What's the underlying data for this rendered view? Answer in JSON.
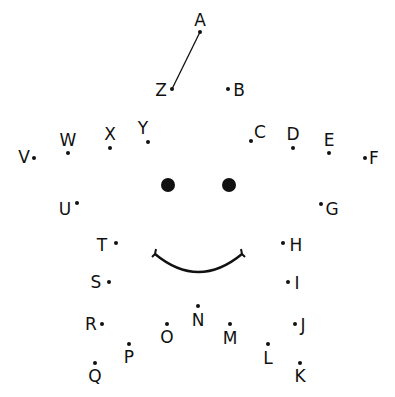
{
  "colors": {
    "ink": "#111111",
    "background": "#ffffff"
  },
  "points": [
    {
      "letter": "A",
      "x": 200,
      "y": 32,
      "lx": 200,
      "ly": 20
    },
    {
      "letter": "B",
      "x": 228,
      "y": 89,
      "lx": 239,
      "ly": 90
    },
    {
      "letter": "C",
      "x": 251,
      "y": 141,
      "lx": 260,
      "ly": 132
    },
    {
      "letter": "D",
      "x": 293,
      "y": 148,
      "lx": 293,
      "ly": 134
    },
    {
      "letter": "E",
      "x": 329,
      "y": 153,
      "lx": 329,
      "ly": 140
    },
    {
      "letter": "F",
      "x": 365,
      "y": 158,
      "lx": 374,
      "ly": 158
    },
    {
      "letter": "G",
      "x": 321,
      "y": 204,
      "lx": 332,
      "ly": 209
    },
    {
      "letter": "H",
      "x": 283,
      "y": 243,
      "lx": 296,
      "ly": 245
    },
    {
      "letter": "I",
      "x": 288,
      "y": 282,
      "lx": 297,
      "ly": 283
    },
    {
      "letter": "J",
      "x": 295,
      "y": 324,
      "lx": 303,
      "ly": 325
    },
    {
      "letter": "K",
      "x": 300,
      "y": 363,
      "lx": 300,
      "ly": 376
    },
    {
      "letter": "L",
      "x": 268,
      "y": 344,
      "lx": 268,
      "ly": 358
    },
    {
      "letter": "M",
      "x": 230,
      "y": 324,
      "lx": 230,
      "ly": 338
    },
    {
      "letter": "N",
      "x": 198,
      "y": 306,
      "lx": 198,
      "ly": 320
    },
    {
      "letter": "O",
      "x": 167,
      "y": 324,
      "lx": 167,
      "ly": 337
    },
    {
      "letter": "P",
      "x": 129,
      "y": 344,
      "lx": 129,
      "ly": 357
    },
    {
      "letter": "Q",
      "x": 95,
      "y": 363,
      "lx": 95,
      "ly": 376
    },
    {
      "letter": "R",
      "x": 102,
      "y": 324,
      "lx": 91,
      "ly": 324
    },
    {
      "letter": "S",
      "x": 109,
      "y": 282,
      "lx": 96,
      "ly": 282
    },
    {
      "letter": "T",
      "x": 116,
      "y": 243,
      "lx": 102,
      "ly": 245
    },
    {
      "letter": "U",
      "x": 77,
      "y": 203,
      "lx": 65,
      "ly": 209
    },
    {
      "letter": "V",
      "x": 34,
      "y": 158,
      "lx": 24,
      "ly": 157
    },
    {
      "letter": "W",
      "x": 68,
      "y": 153,
      "lx": 68,
      "ly": 140
    },
    {
      "letter": "X",
      "x": 110,
      "y": 148,
      "lx": 110,
      "ly": 134
    },
    {
      "letter": "Y",
      "x": 148,
      "y": 142,
      "lx": 143,
      "ly": 128
    },
    {
      "letter": "Z",
      "x": 172,
      "y": 89,
      "lx": 161,
      "ly": 90
    }
  ],
  "connected_line": {
    "from": "A",
    "to": "Z"
  },
  "face": {
    "eyes": [
      {
        "x": 168,
        "y": 185
      },
      {
        "x": 229,
        "y": 185
      }
    ],
    "smile": {
      "x1": 155,
      "y1": 254,
      "x2": 242,
      "y2": 254,
      "cy": 290
    }
  }
}
